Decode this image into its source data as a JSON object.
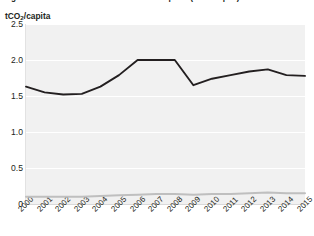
{
  "figure": {
    "caption": "Figure 12: CO2 emissions embodied into imports (tCO2/capita)",
    "y_axis_title_main": "tCO",
    "y_axis_title_sub": "2",
    "y_axis_title_tail": "/capita"
  },
  "colors": {
    "plot_background": "#f1f1f1",
    "gridline": "#ffffff",
    "series_imports": "#231f20",
    "series_secondary": "#bfbfbf",
    "text": "#231f20",
    "axis": "#d9d9d9"
  },
  "chart_data": {
    "type": "line",
    "title": "Figure 12: CO2 emissions embodied into imports (tCO2/capita)",
    "xlabel": "",
    "ylabel": "tCO2/capita",
    "ylim": [
      0,
      2.5
    ],
    "yticks": [
      "0",
      "0.5",
      "1.0",
      "1.5",
      "2.0",
      "2.5"
    ],
    "ytick_values": [
      0,
      0.5,
      1.0,
      1.5,
      2.0,
      2.5
    ],
    "grid": true,
    "legend": "none",
    "x": [
      "2000",
      "2001",
      "2002",
      "2003",
      "2004",
      "2005",
      "2006",
      "2007",
      "2008",
      "2009",
      "2010",
      "2011",
      "2012",
      "2013",
      "2014",
      "2015"
    ],
    "series": [
      {
        "name": "Emissions embodied into imports",
        "color": "#231f20",
        "values": [
          1.63,
          1.55,
          1.52,
          1.53,
          1.63,
          1.79,
          2.0,
          2.0,
          2.0,
          1.65,
          1.74,
          1.79,
          1.84,
          1.87,
          1.79,
          1.78
        ]
      },
      {
        "name": "Secondary series",
        "color": "#bfbfbf",
        "values": [
          0.1,
          0.1,
          0.1,
          0.1,
          0.11,
          0.12,
          0.13,
          0.14,
          0.14,
          0.13,
          0.14,
          0.14,
          0.15,
          0.16,
          0.15,
          0.15
        ]
      }
    ]
  }
}
